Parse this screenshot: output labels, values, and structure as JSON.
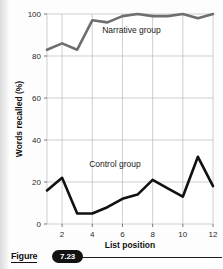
{
  "figure": {
    "caption_word": "Figure",
    "number_badge": "7.23"
  },
  "chart_data": {
    "type": "line",
    "title": "",
    "xlabel": "List position",
    "ylabel": "Words recalled (%)",
    "xlim": [
      1,
      12
    ],
    "ylim": [
      0,
      100
    ],
    "xticks": [
      2,
      4,
      6,
      8,
      10,
      12
    ],
    "yticks": [
      0,
      20,
      40,
      60,
      80,
      100
    ],
    "grid": true,
    "legend_position": "inline-annotation",
    "x": [
      1,
      2,
      3,
      4,
      5,
      6,
      7,
      8,
      9,
      10,
      11,
      12
    ],
    "series": [
      {
        "name": "Narrative group",
        "color": "#6e6e6e",
        "values": [
          83,
          86,
          83,
          97,
          96,
          99,
          100,
          99,
          99,
          100,
          98,
          100
        ]
      },
      {
        "name": "Control group",
        "color": "#111111",
        "values": [
          16,
          22,
          5,
          5,
          8,
          12,
          14,
          21,
          17,
          13,
          32,
          18
        ]
      }
    ],
    "annotations": [
      {
        "text": "Narrative group",
        "x": 6.6,
        "y": 91
      },
      {
        "text": "Control group",
        "x": 5.5,
        "y": 27
      }
    ]
  }
}
